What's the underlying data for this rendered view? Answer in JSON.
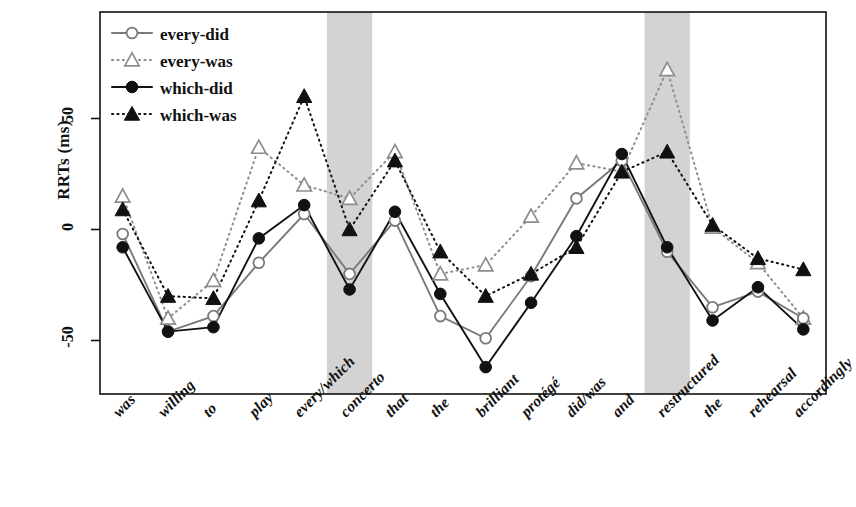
{
  "chart_data": {
    "type": "line",
    "title": "",
    "xlabel": "",
    "ylabel": "RRTs (ms)",
    "ylim": [
      -75,
      80
    ],
    "yticks": [
      -50,
      0,
      50
    ],
    "ytick_labels": [
      "-50",
      "0",
      "50"
    ],
    "grid": false,
    "legend_position": "top-left",
    "categories": [
      "was",
      "willing",
      "to",
      "play",
      "every/which",
      "concerto",
      "that",
      "the",
      "brilliant",
      "protégé",
      "did/was",
      "and",
      "restructured",
      "the",
      "rehearsal",
      "accordingly"
    ],
    "shaded_regions": [
      {
        "label": "concerto",
        "from_index": 5,
        "to_index": 5
      },
      {
        "label": "restructured",
        "from_index": 12,
        "to_index": 12
      }
    ],
    "series": [
      {
        "name": "every-did",
        "marker": "open-circle",
        "line": "solid",
        "color": "#7a7a7a",
        "values": [
          -2,
          -46,
          -39,
          -15,
          7,
          -20,
          4,
          -39,
          -49,
          -21,
          14,
          31,
          -10,
          -35,
          -28,
          -40
        ]
      },
      {
        "name": "every-was",
        "marker": "open-triangle",
        "line": "dotted",
        "color": "#8d8d8d",
        "values": [
          15,
          -40,
          -23,
          37,
          20,
          14,
          35,
          -20,
          -16,
          6,
          30,
          26,
          72,
          1,
          -15,
          -40
        ]
      },
      {
        "name": "which-did",
        "marker": "filled-circle",
        "line": "solid",
        "color": "#111111",
        "values": [
          -8,
          -46,
          -44,
          -4,
          11,
          -27,
          8,
          -29,
          -62,
          -33,
          -3,
          34,
          -8,
          -41,
          -26,
          -45
        ]
      },
      {
        "name": "which-was",
        "marker": "filled-triangle",
        "line": "dotted",
        "color": "#111111",
        "values": [
          9,
          -30,
          -31,
          13,
          60,
          0,
          31,
          -10,
          -30,
          -20,
          -8,
          26,
          35,
          2,
          -13,
          -18
        ]
      }
    ]
  },
  "legend": {
    "entries": [
      {
        "label": "every-did"
      },
      {
        "label": "every-was"
      },
      {
        "label": "which-did"
      },
      {
        "label": "which-was"
      }
    ]
  },
  "axis": {
    "y_title": "RRTs (ms)",
    "y_tick_0": "50",
    "y_tick_1": "0",
    "y_tick_2": "-50"
  },
  "xlabels": {
    "l0": "was",
    "l1": "willing",
    "l2": "to",
    "l3": "play",
    "l4": "every/which",
    "l5": "concerto",
    "l6": "that",
    "l7": "the",
    "l8": "brilliant",
    "l9": "protégé",
    "l10": "did/was",
    "l11": "and",
    "l12": "restructured",
    "l13": "the",
    "l14": "rehearsal",
    "l15": "accordingly"
  }
}
